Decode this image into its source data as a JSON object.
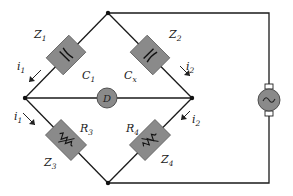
{
  "diagram": {
    "type": "AC bridge circuit (Schering-type capacitance bridge)",
    "components": {
      "z1": {
        "name": "Z",
        "sub": "1",
        "element": "C",
        "element_sub": "1",
        "kind": "capacitor"
      },
      "z2": {
        "name": "Z",
        "sub": "2",
        "element": "C",
        "element_sub": "x",
        "kind": "capacitor"
      },
      "z3": {
        "name": "Z",
        "sub": "3",
        "element": "R",
        "element_sub": "3",
        "kind": "variable-resistor"
      },
      "z4": {
        "name": "Z",
        "sub": "4",
        "element": "R",
        "element_sub": "4",
        "kind": "variable-resistor"
      },
      "detector": {
        "label": "D"
      },
      "source": {
        "symbol": "~",
        "kind": "ac-source"
      }
    },
    "currents": {
      "i1_top": {
        "name": "i",
        "sub": "1"
      },
      "i1_bottom": {
        "name": "i",
        "sub": "1"
      },
      "i2_top": {
        "name": "i",
        "sub": "2"
      },
      "i2_bottom": {
        "name": "i",
        "sub": "2"
      }
    },
    "colors": {
      "component_fill": "#8a8a8a",
      "wire": "#1a1a1a",
      "background": "#ffffff"
    }
  }
}
